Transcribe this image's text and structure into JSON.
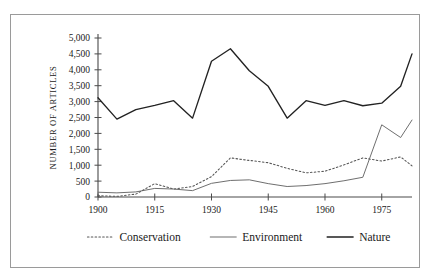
{
  "chart_data": {
    "type": "line",
    "title": "",
    "xlabel": "",
    "ylabel": "NUMBER OF ARTICLES",
    "xlim": [
      1900,
      1983
    ],
    "ylim": [
      0,
      5000
    ],
    "grid": false,
    "legend_position": "bottom",
    "xticks": [
      "1900",
      "1915",
      "1930",
      "1945",
      "1960",
      "1975"
    ],
    "xtick_values": [
      1900,
      1915,
      1930,
      1945,
      1960,
      1975
    ],
    "yticks": [
      "0",
      "500",
      "1,000",
      "1,500",
      "2,000",
      "2,500",
      "3,000",
      "3,500",
      "4,000",
      "4,500",
      "5,000"
    ],
    "ytick_values": [
      0,
      500,
      1000,
      1500,
      2000,
      2500,
      3000,
      3500,
      4000,
      4500,
      5000
    ],
    "x": [
      1900,
      1905,
      1910,
      1915,
      1920,
      1925,
      1930,
      1935,
      1940,
      1945,
      1950,
      1955,
      1960,
      1965,
      1970,
      1975,
      1980,
      1983
    ],
    "series": [
      {
        "name": "Conservation",
        "style": "dotted",
        "color": "#555555",
        "values": [
          40,
          20,
          90,
          420,
          250,
          330,
          640,
          1230,
          1150,
          1080,
          900,
          760,
          810,
          1010,
          1230,
          1130,
          1260,
          980
        ]
      },
      {
        "name": "Environment",
        "style": "solid-thin",
        "color": "#666666",
        "values": [
          150,
          130,
          160,
          270,
          250,
          200,
          430,
          520,
          540,
          420,
          330,
          360,
          420,
          510,
          620,
          2270,
          1870,
          2420
        ]
      },
      {
        "name": "Nature",
        "style": "solid-thick",
        "color": "#222222",
        "values": [
          3120,
          2450,
          2750,
          2880,
          3030,
          2480,
          4270,
          4660,
          3970,
          3480,
          2480,
          3030,
          2880,
          3030,
          2870,
          2950,
          3480,
          4500
        ]
      }
    ]
  },
  "legend": {
    "items": [
      {
        "label": "Conservation",
        "swatch": "dotted-line-icon"
      },
      {
        "label": "Environment",
        "swatch": "thin-line-icon"
      },
      {
        "label": "Nature",
        "swatch": "thick-line-icon"
      }
    ]
  },
  "colors": {
    "frame_border": "#9a9a9a",
    "axis": "#4a4a4a",
    "background": "#ffffff",
    "text": "#1a1a1a"
  }
}
